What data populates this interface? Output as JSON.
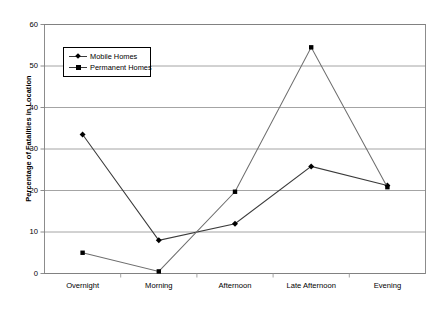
{
  "chart_data": {
    "type": "line",
    "title": "",
    "xlabel": "",
    "ylabel": "Percentage of Fatalities in Location",
    "categories": [
      "Overnight",
      "Morning",
      "Afternoon",
      "Late Afternoon",
      "Evening"
    ],
    "ylim": [
      0,
      60
    ],
    "yticks": [
      0,
      10,
      20,
      30,
      40,
      50,
      60
    ],
    "ytick_labels": [
      "0",
      "10",
      "20",
      "30",
      "40",
      "50",
      "60"
    ],
    "grid": "horizontal",
    "legend_position": "upper-left-inside",
    "series": [
      {
        "name": "Mobile Homes",
        "marker": "diamond",
        "color": "#000000",
        "line_color": "#3a3a3a",
        "values": [
          33.5,
          8.0,
          12.0,
          25.8,
          21.2
        ]
      },
      {
        "name": "Permanent Homes",
        "marker": "square",
        "color": "#000000",
        "line_color": "#6e6e6e",
        "values": [
          5.0,
          0.5,
          19.7,
          54.5,
          20.8
        ]
      }
    ]
  },
  "axis": {
    "y_title": "Percentage of Fatalities in Location"
  },
  "legend": {
    "items": [
      {
        "label": "Mobile Homes"
      },
      {
        "label": "Permanent Homes"
      }
    ]
  }
}
